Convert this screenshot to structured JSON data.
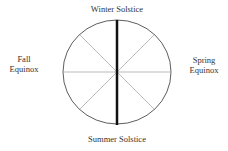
{
  "labels": {
    "top": "Winter Solstice",
    "bottom": "Summer Solstice",
    "left": [
      "Fall",
      "Equinox"
    ],
    "right": [
      "Spring",
      "Equinox"
    ]
  },
  "colors": {
    "circle": "#333333",
    "spokes": "#aaaaaa",
    "axis": "#111111"
  }
}
